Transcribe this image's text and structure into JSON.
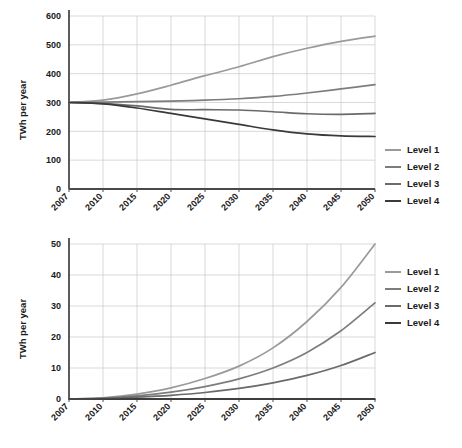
{
  "figure": {
    "background_color": "#ffffff",
    "grid_color": "#c8c8c8",
    "axis_color": "#4a4a4a"
  },
  "series_colors": {
    "level1": "#9a9a9a",
    "level2": "#7d7d7d",
    "level3": "#6a6a6a",
    "level4": "#3a3a3a"
  },
  "legend": {
    "items": [
      {
        "label": "Level 1",
        "color": "#9a9a9a"
      },
      {
        "label": "Level 2",
        "color": "#7d7d7d"
      },
      {
        "label": "Level 3",
        "color": "#6a6a6a"
      },
      {
        "label": "Level 4",
        "color": "#3a3a3a"
      }
    ]
  },
  "chart_data": [
    {
      "id": "top",
      "type": "line",
      "title": "",
      "xlabel": "",
      "ylabel": "TWh per year",
      "x": [
        2007,
        2010,
        2015,
        2020,
        2025,
        2030,
        2035,
        2040,
        2045,
        2050
      ],
      "xtick_labels": [
        "2007",
        "2010",
        "2015",
        "2020",
        "2025",
        "2030",
        "2035",
        "2040",
        "2045",
        "2050"
      ],
      "ytick_labels": [
        "0",
        "100",
        "200",
        "300",
        "400",
        "500",
        "600"
      ],
      "yticks": [
        0,
        100,
        200,
        300,
        400,
        500,
        600
      ],
      "ylim": [
        0,
        600
      ],
      "grid": true,
      "legend_position": "right",
      "series": [
        {
          "name": "Level 1",
          "color": "#9a9a9a",
          "values": [
            300,
            308,
            330,
            360,
            393,
            424,
            459,
            488,
            512,
            530
          ]
        },
        {
          "name": "Level 2",
          "color": "#7d7d7d",
          "values": [
            300,
            301,
            303,
            305,
            308,
            313,
            321,
            333,
            347,
            362
          ]
        },
        {
          "name": "Level 3",
          "color": "#6a6a6a",
          "values": [
            300,
            297,
            288,
            276,
            275,
            274,
            268,
            261,
            259,
            262
          ]
        },
        {
          "name": "Level 4",
          "color": "#3a3a3a",
          "values": [
            300,
            295,
            281,
            262,
            243,
            224,
            205,
            191,
            184,
            182
          ]
        }
      ]
    },
    {
      "id": "bottom",
      "type": "line",
      "title": "",
      "xlabel": "",
      "ylabel": "TWh per year",
      "x": [
        2007,
        2010,
        2015,
        2020,
        2025,
        2030,
        2035,
        2040,
        2045,
        2050
      ],
      "xtick_labels": [
        "2007",
        "2010",
        "2015",
        "2020",
        "2025",
        "2030",
        "2035",
        "2040",
        "2045",
        "2050"
      ],
      "ytick_labels": [
        "0",
        "10",
        "20",
        "30",
        "40",
        "50"
      ],
      "yticks": [
        0,
        10,
        20,
        30,
        40,
        50
      ],
      "ylim": [
        0,
        50
      ],
      "grid": true,
      "legend_position": "right",
      "series": [
        {
          "name": "Level 1",
          "color": "#9a9a9a",
          "values": [
            0,
            0.4,
            1.6,
            3.6,
            6.6,
            10.6,
            16.5,
            25.0,
            36.0,
            50.0
          ]
        },
        {
          "name": "Level 2",
          "color": "#7d7d7d",
          "values": [
            0,
            0.3,
            1.0,
            2.2,
            4.0,
            6.5,
            10.0,
            15.0,
            22.0,
            31.0
          ]
        },
        {
          "name": "Level 3",
          "color": "#6a6a6a",
          "values": [
            0,
            0.15,
            0.6,
            1.2,
            2.1,
            3.4,
            5.2,
            7.6,
            10.8,
            15.0
          ]
        },
        {
          "name": "Level 4",
          "color": "#3a3a3a",
          "values": [
            0,
            0,
            0,
            0,
            0,
            0,
            0,
            0,
            0,
            0
          ]
        }
      ]
    }
  ]
}
